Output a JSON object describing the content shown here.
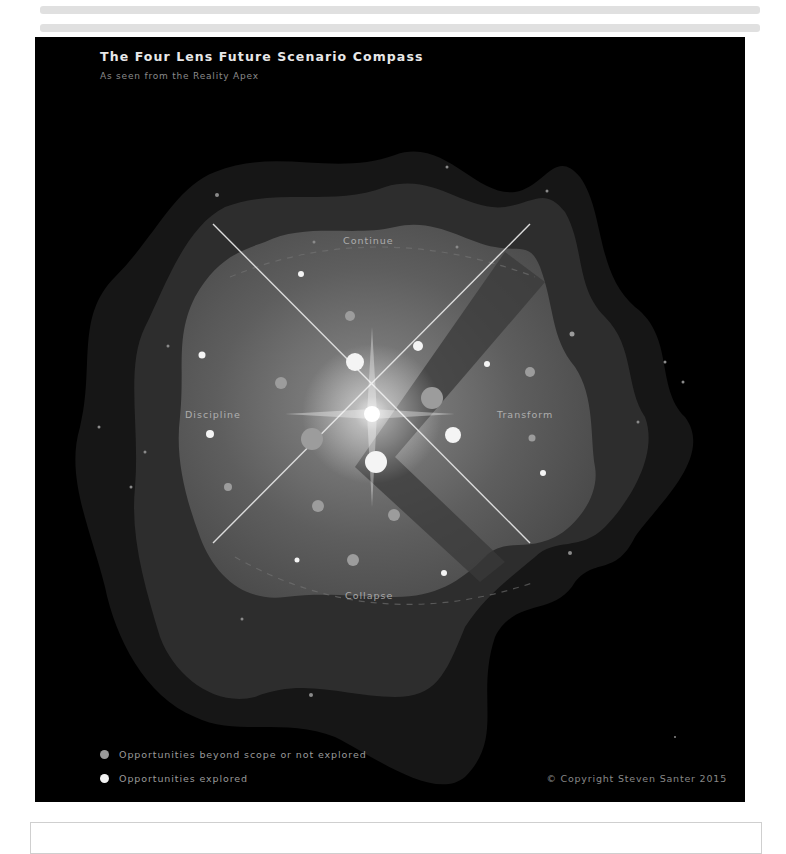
{
  "figure": {
    "title": "The Four Lens Future Scenario Compass",
    "subtitle": "As seen from the Reality Apex",
    "quadrants": {
      "top": "Continue",
      "left": "Discipline",
      "right": "Transform",
      "bottom": "Collapse"
    },
    "legend": [
      {
        "label": "Opportunities beyond scope or not explored",
        "color": "#9a9a9a"
      },
      {
        "label": "Opportunities explored",
        "color": "#f2f2f2"
      }
    ],
    "copyright": "© Copyright Steven Santer 2015"
  },
  "colors": {
    "background": "#000000",
    "layer_outer": "#151515",
    "layer_mid": "#2c2c2c",
    "layer_inner": "#575757",
    "axis_lines": "#d8d8d8",
    "explored": "#f2f2f2",
    "not_explored": "#9a9a9a"
  }
}
